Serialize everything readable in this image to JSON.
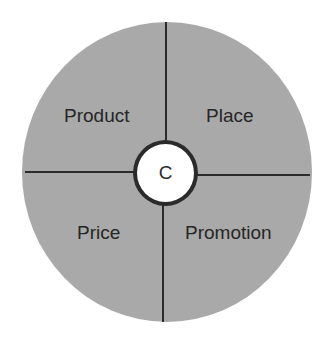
{
  "diagram": {
    "type": "marketing-mix-wheel",
    "center": {
      "label": "C"
    },
    "quadrants": [
      {
        "position": "top-left",
        "label": "Product"
      },
      {
        "position": "top-right",
        "label": "Place"
      },
      {
        "position": "bottom-left",
        "label": "Price"
      },
      {
        "position": "bottom-right",
        "label": "Promotion"
      }
    ],
    "colors": {
      "fill": "#a9a9a9",
      "lines": "#2b2b2b",
      "center_fill": "#ffffff"
    }
  }
}
